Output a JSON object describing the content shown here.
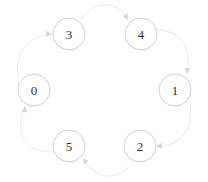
{
  "diagram": {
    "type": "directed-cycle-graph",
    "colors": {
      "background": "#ffffff",
      "node_stroke": "#cfcfcf",
      "node_fill": "#ffffff",
      "label": "#333333",
      "edge": "#ececec",
      "arrow": "#d8d8d8"
    },
    "nodes": [
      {
        "id": "0",
        "label": "0"
      },
      {
        "id": "3",
        "label": "3"
      },
      {
        "id": "4",
        "label": "4"
      },
      {
        "id": "1",
        "label": "1"
      },
      {
        "id": "2",
        "label": "2"
      },
      {
        "id": "5",
        "label": "5"
      }
    ],
    "edges": [
      {
        "from": "0",
        "to": "3"
      },
      {
        "from": "3",
        "to": "4"
      },
      {
        "from": "4",
        "to": "1"
      },
      {
        "from": "1",
        "to": "2"
      },
      {
        "from": "2",
        "to": "5"
      },
      {
        "from": "5",
        "to": "0"
      }
    ]
  }
}
